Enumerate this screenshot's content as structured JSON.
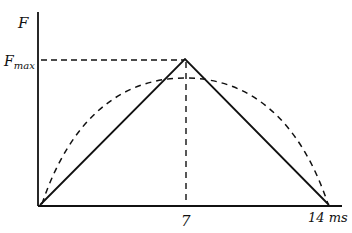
{
  "diagram": {
    "type": "force-time impulse sketch",
    "y_axis": {
      "label": "F",
      "marker_label": "F",
      "marker_subscript": "max"
    },
    "x_axis": {
      "ticks": [
        "7",
        "14 ms"
      ]
    },
    "curves": [
      {
        "name": "triangular pulse",
        "style": "solid",
        "points": [
          [
            0,
            0
          ],
          [
            7,
            "Fmax"
          ],
          [
            14,
            0
          ]
        ]
      },
      {
        "name": "half-sine pulse",
        "style": "dashed",
        "peak_at": 7,
        "peak_value": "below Fmax"
      }
    ],
    "guides": [
      {
        "name": "Fmax level",
        "style": "dashed",
        "from_x": 0,
        "to_x": 7
      },
      {
        "name": "peak time",
        "style": "dashed",
        "at_x": 7
      }
    ],
    "colors": {
      "ink": "#111111",
      "background": "#ffffff"
    }
  }
}
